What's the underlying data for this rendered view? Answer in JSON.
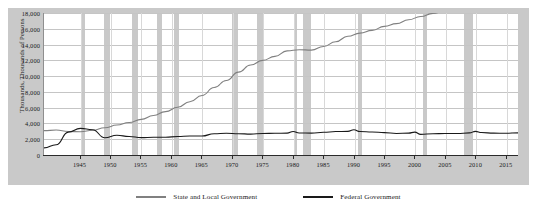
{
  "chart_data": {
    "type": "line",
    "title": "",
    "xlabel": "",
    "ylabel": "Thousands, Thousands of Persons",
    "xlim": [
      1939,
      2017
    ],
    "ylim": [
      0,
      18000
    ],
    "grid": true,
    "legend_position": "bottom",
    "ytick_labels": [
      "18,000",
      "16,000",
      "14,000",
      "12,000",
      "10,000",
      "8,000",
      "6,000",
      "4,000",
      "2,000",
      "0"
    ],
    "ytick_values": [
      18000,
      16000,
      14000,
      12000,
      10000,
      8000,
      6000,
      4000,
      2000,
      0
    ],
    "xtick_labels": [
      "1945",
      "1950",
      "1955",
      "1960",
      "1965",
      "1970",
      "1975",
      "1980",
      "1985",
      "1990",
      "1995",
      "2000",
      "2005",
      "2010",
      "2015"
    ],
    "xtick_values": [
      1945,
      1950,
      1955,
      1960,
      1965,
      1970,
      1975,
      1980,
      1985,
      1990,
      1995,
      2000,
      2005,
      2010,
      2015
    ],
    "colors": {
      "state_local": "#808080",
      "federal": "#1a1a1a",
      "recession_band": "#c0c0c0",
      "panel_background": "#c9c9c9",
      "plot_background": "#ffffff",
      "gridline": "#c5c5c5"
    },
    "recession_bands": [
      [
        1945.1,
        1945.8
      ],
      [
        1948.9,
        1949.8
      ],
      [
        1953.5,
        1954.4
      ],
      [
        1957.6,
        1958.3
      ],
      [
        1960.3,
        1961.1
      ],
      [
        1969.9,
        1970.9
      ],
      [
        1973.9,
        1975.2
      ],
      [
        1980.0,
        1980.5
      ],
      [
        1981.5,
        1982.9
      ],
      [
        1990.5,
        1991.2
      ],
      [
        2001.2,
        2001.9
      ],
      [
        2007.9,
        2009.5
      ]
    ],
    "series": [
      {
        "name": "State and Local Government",
        "color": "#808080",
        "x": [
          1939,
          1941,
          1943,
          1945,
          1947,
          1949,
          1951,
          1953,
          1955,
          1957,
          1959,
          1961,
          1963,
          1965,
          1967,
          1969,
          1971,
          1973,
          1975,
          1977,
          1979,
          1981,
          1983,
          1985,
          1987,
          1989,
          1991,
          1993,
          1995,
          1997,
          1999,
          2001,
          2003,
          2005,
          2007,
          2009,
          2010,
          2011,
          2013,
          2015,
          2017
        ],
        "values": [
          3090,
          3160,
          2980,
          2950,
          3130,
          3450,
          3800,
          4120,
          4520,
          5000,
          5500,
          6050,
          6750,
          7550,
          8550,
          9450,
          10500,
          11400,
          12000,
          12500,
          13200,
          13350,
          13300,
          13750,
          14350,
          15050,
          15450,
          15800,
          16300,
          16650,
          17150,
          17550,
          17950,
          18250,
          18600,
          18900,
          18800,
          18500,
          18350,
          18350,
          18450
        ]
      },
      {
        "name": "Federal Government",
        "color": "#1a1a1a",
        "x": [
          1939,
          1941,
          1943,
          1945,
          1947,
          1949,
          1951,
          1953,
          1955,
          1957,
          1959,
          1961,
          1963,
          1965,
          1967,
          1969,
          1971,
          1973,
          1975,
          1977,
          1979,
          1980,
          1981,
          1983,
          1985,
          1987,
          1989,
          1990,
          1991,
          1993,
          1995,
          1997,
          1999,
          2000,
          2001,
          2003,
          2005,
          2007,
          2009,
          2010,
          2011,
          2013,
          2015,
          2017
        ],
        "values": [
          900,
          1300,
          2900,
          3380,
          3200,
          2180,
          2500,
          2350,
          2200,
          2250,
          2250,
          2350,
          2400,
          2400,
          2700,
          2750,
          2700,
          2650,
          2730,
          2750,
          2770,
          2980,
          2790,
          2770,
          2880,
          2970,
          2990,
          3200,
          2970,
          2920,
          2830,
          2730,
          2770,
          2900,
          2620,
          2700,
          2730,
          2730,
          2800,
          3000,
          2850,
          2770,
          2760,
          2810
        ]
      }
    ]
  },
  "legend": {
    "items": [
      {
        "label": "State and Local Government",
        "color": "#808080"
      },
      {
        "label": "Federal Government",
        "color": "#1a1a1a"
      }
    ]
  }
}
